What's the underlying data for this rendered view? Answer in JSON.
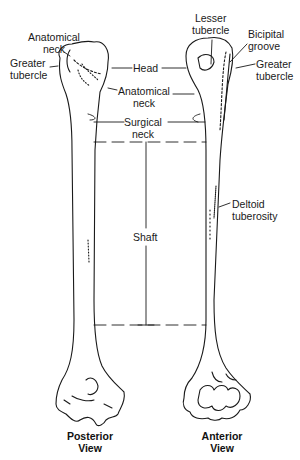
{
  "diagram": {
    "views": [
      {
        "id": "posterior",
        "label": "Posterior\nView"
      },
      {
        "id": "anterior",
        "label": "Anterior\nView"
      }
    ],
    "labels": {
      "anatomical_neck_top": "Anatomical\nneck",
      "greater_tubercle_left": "Greater\ntubercle",
      "head": "Head",
      "anatomical_neck_center": "Anatomical\nneck",
      "surgical_neck": "Surgical\nneck",
      "shaft": "Shaft",
      "lesser_tubercle": "Lesser\ntubercle",
      "bicipital_groove": "Bicipital\ngroove",
      "greater_tubercle_right": "Greater\ntubercle",
      "deltoid_tuberosity": "Deltoid\ntuberosity"
    },
    "colors": {
      "line": "#1a1a1a",
      "background": "#ffffff"
    }
  }
}
